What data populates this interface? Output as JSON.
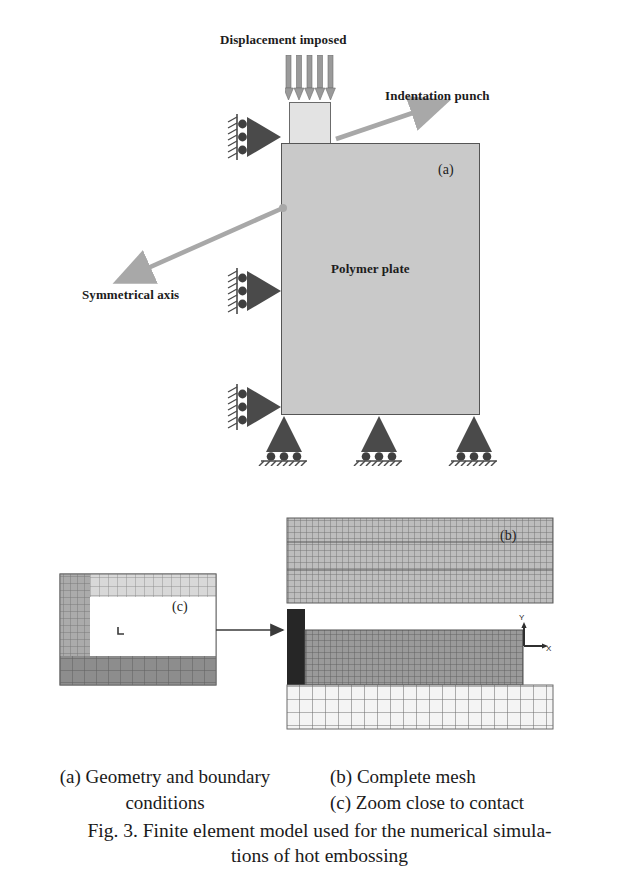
{
  "figure": {
    "number": "Fig. 3.",
    "caption_line1": "Fig. 3. Finite element model used for the numerical simula-",
    "caption_line2": "tions of hot embossing",
    "subcaptions": {
      "a_line1": "(a) Geometry and boundary",
      "a_line2": "conditions",
      "b": "(b) Complete mesh",
      "c": "(c) Zoom close to contact"
    }
  },
  "panel_a": {
    "tag": "(a)",
    "labels": {
      "displacement": "Displacement imposed",
      "indentation_punch": "Indentation punch",
      "symmetrical_axis": "Symmetrical axis",
      "polymer_plate": "Polymer plate"
    },
    "arrow_count_load": 5,
    "supports": {
      "left_count": 2,
      "bottom_count": 3,
      "roller_count_each": 3,
      "type": "roller-support"
    },
    "colors": {
      "plate_fill": "#c9c9c9",
      "plate_stroke": "#555555",
      "punch_fill": "#e3e3e3",
      "punch_stroke": "#6b6b6b",
      "support_fill": "#4a4a4a",
      "arrow_grey": "#9a9a9a",
      "pointer_grey": "#a8a8a8"
    },
    "geometry": {
      "plate_x": 281,
      "plate_y": 143,
      "plate_w": 199,
      "plate_h": 272,
      "punch_x": 289,
      "punch_y": 72,
      "punch_w": 42,
      "punch_h": 71
    }
  },
  "panel_b": {
    "tag": "(b)",
    "axis_labels": {
      "y": "Y",
      "x": "X"
    },
    "regions": [
      {
        "name": "upper-tool-mesh",
        "shade": "#b6b6b6",
        "cell": 6
      },
      {
        "name": "punch-block",
        "shade": "#2a2a2a"
      },
      {
        "name": "polymer-mesh",
        "shade": "#8f8f8f",
        "cell": 6
      },
      {
        "name": "support-mesh",
        "shade": "#f2f2f2",
        "cell": 13
      }
    ],
    "colors": {
      "grid_line": "#6f6f6f",
      "connector": "#3a3a3a"
    }
  },
  "panel_c": {
    "tag": "(c)",
    "regions": [
      {
        "name": "top-mesh",
        "shade": "#d5d5d5"
      },
      {
        "name": "left-mesh",
        "shade": "#a9a9a9"
      },
      {
        "name": "cavity",
        "shade": "#ffffff"
      },
      {
        "name": "bottom-mesh",
        "shade": "#8b8b8b"
      }
    ],
    "colors": {
      "grid_line": "#7b7b7b",
      "border": "#6a6a6a"
    }
  }
}
